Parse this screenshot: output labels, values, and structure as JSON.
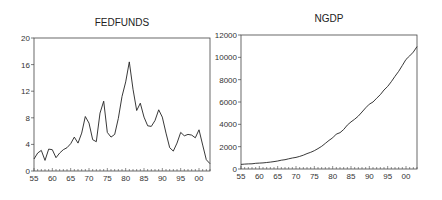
{
  "chart_data": [
    {
      "type": "line",
      "title": "FEDFUNDS",
      "xlabel": "",
      "ylabel": "",
      "ylim": [
        0,
        20
      ],
      "xlim": [
        1955,
        2003
      ],
      "yticks": [
        "0",
        "4",
        "8",
        "12",
        "16",
        "20"
      ],
      "xticks": [
        "55",
        "60",
        "65",
        "70",
        "75",
        "80",
        "85",
        "90",
        "95",
        "00"
      ],
      "grid": false,
      "legend": null,
      "x": [
        1955,
        1956,
        1957,
        1958,
        1959,
        1960,
        1961,
        1962,
        1963,
        1964,
        1965,
        1966,
        1967,
        1968,
        1969,
        1970,
        1971,
        1972,
        1973,
        1974,
        1975,
        1976,
        1977,
        1978,
        1979,
        1980,
        1981,
        1982,
        1983,
        1984,
        1985,
        1986,
        1987,
        1988,
        1989,
        1990,
        1991,
        1992,
        1993,
        1994,
        1995,
        1996,
        1997,
        1998,
        1999,
        2000,
        2001,
        2002,
        2003
      ],
      "series": [
        {
          "name": "FEDFUNDS",
          "values": [
            1.8,
            2.7,
            3.1,
            1.6,
            3.3,
            3.2,
            2.0,
            2.7,
            3.2,
            3.5,
            4.1,
            5.1,
            4.2,
            5.7,
            8.2,
            7.2,
            4.7,
            4.4,
            8.7,
            10.5,
            5.8,
            5.1,
            5.5,
            7.9,
            11.2,
            13.4,
            16.4,
            12.3,
            9.1,
            10.2,
            8.1,
            6.8,
            6.7,
            7.6,
            9.2,
            8.1,
            5.7,
            3.5,
            3.0,
            4.2,
            5.8,
            5.3,
            5.5,
            5.4,
            5.0,
            6.2,
            3.9,
            1.7,
            1.1
          ]
        }
      ]
    },
    {
      "type": "line",
      "title": "NGDP",
      "xlabel": "",
      "ylabel": "",
      "ylim": [
        0,
        12000
      ],
      "xlim": [
        1955,
        2003
      ],
      "yticks": [
        "0",
        "2000",
        "4000",
        "6000",
        "8000",
        "10000",
        "12000"
      ],
      "xticks": [
        "55",
        "60",
        "65",
        "70",
        "75",
        "80",
        "85",
        "90",
        "95",
        "00"
      ],
      "grid": false,
      "legend": null,
      "x": [
        1955,
        1956,
        1957,
        1958,
        1959,
        1960,
        1961,
        1962,
        1963,
        1964,
        1965,
        1966,
        1967,
        1968,
        1969,
        1970,
        1971,
        1972,
        1973,
        1974,
        1975,
        1976,
        1977,
        1978,
        1979,
        1980,
        1981,
        1982,
        1983,
        1984,
        1985,
        1986,
        1987,
        1988,
        1989,
        1990,
        1991,
        1992,
        1993,
        1994,
        1995,
        1996,
        1997,
        1998,
        1999,
        2000,
        2001,
        2002,
        2003
      ],
      "series": [
        {
          "name": "NGDP",
          "values": [
            415,
            438,
            461,
            467,
            506,
            526,
            545,
            586,
            618,
            664,
            719,
            788,
            833,
            911,
            986,
            1039,
            1127,
            1238,
            1383,
            1500,
            1638,
            1825,
            2031,
            2295,
            2563,
            2790,
            3128,
            3255,
            3537,
            3933,
            4220,
            4463,
            4740,
            5104,
            5484,
            5803,
            5996,
            6338,
            6657,
            7072,
            7398,
            7817,
            8304,
            8747,
            9268,
            9817,
            10128,
            10470,
            10961
          ]
        }
      ]
    }
  ],
  "charts": {
    "left": {
      "title": "FEDFUNDS"
    },
    "right": {
      "title": "NGDP"
    }
  }
}
